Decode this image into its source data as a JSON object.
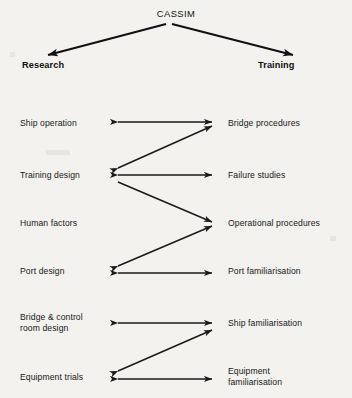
{
  "diagram": {
    "root": {
      "label": "CASSIM"
    },
    "branches": {
      "left": "Research",
      "right": "Training"
    },
    "rows": [
      {
        "left": "Ship operation",
        "right": "Bridge procedures"
      },
      {
        "left": "Training design",
        "right": "Failure studies"
      },
      {
        "left": "Human factors",
        "right": "Operational procedures"
      },
      {
        "left": "Port design",
        "right": "Port familiarisation"
      },
      {
        "left": "Bridge & control\nroom design",
        "right": "Ship familiarisation"
      },
      {
        "left": "Equipment trials",
        "right": "Equipment\nfamiliarisation"
      }
    ],
    "caption": {
      "text": ""
    },
    "colors": {
      "ink": "#1a1a1a",
      "paper": "#f3f2ef"
    }
  }
}
